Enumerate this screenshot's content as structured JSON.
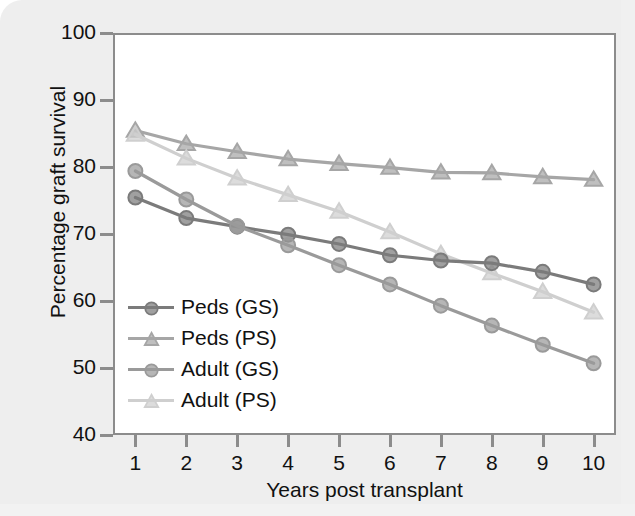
{
  "chart_data": {
    "type": "line",
    "title": "",
    "xlabel": "Years post transplant",
    "ylabel": "Percentage graft survival",
    "x": [
      1,
      2,
      3,
      4,
      5,
      6,
      7,
      8,
      9,
      10
    ],
    "xticklabels": [
      "1",
      "2",
      "3",
      "4",
      "5",
      "6",
      "7",
      "8",
      "9",
      "10"
    ],
    "yticklabels": [
      "100",
      "90",
      "80",
      "70",
      "60",
      "50",
      "40"
    ],
    "yticks": [
      100,
      90,
      80,
      70,
      60,
      50,
      40
    ],
    "xlim": [
      0.6,
      10.4
    ],
    "ylim": [
      40,
      100
    ],
    "grid": false,
    "legend_position": "lower left inside axes",
    "series": [
      {
        "name": "Peds (GS)",
        "marker": "circle",
        "color": "#7b7b7b",
        "values": [
          75.5,
          72.4,
          71.1,
          69.9,
          68.5,
          66.8,
          66.0,
          65.6,
          64.3,
          62.4
        ]
      },
      {
        "name": "Peds (PS)",
        "marker": "triangle",
        "color": "#a6a6a6",
        "values": [
          85.6,
          83.6,
          82.4,
          81.3,
          80.6,
          80.0,
          79.3,
          79.2,
          78.6,
          78.2
        ]
      },
      {
        "name": "Adult (GS)",
        "marker": "circle",
        "color": "#9a9a9a",
        "values": [
          79.5,
          75.2,
          71.2,
          68.3,
          65.3,
          62.4,
          59.2,
          56.2,
          53.3,
          50.5
        ]
      },
      {
        "name": "Adult (PS)",
        "marker": "triangle",
        "color": "#cfcfcf",
        "values": [
          85.0,
          81.4,
          78.4,
          75.9,
          73.4,
          70.3,
          67.0,
          64.1,
          61.3,
          58.2
        ]
      }
    ]
  },
  "figure": {
    "background": "#eeeeee",
    "plot_background": "#ffffff",
    "axis_color": "#8c8c8c",
    "text_color": "#111111"
  }
}
